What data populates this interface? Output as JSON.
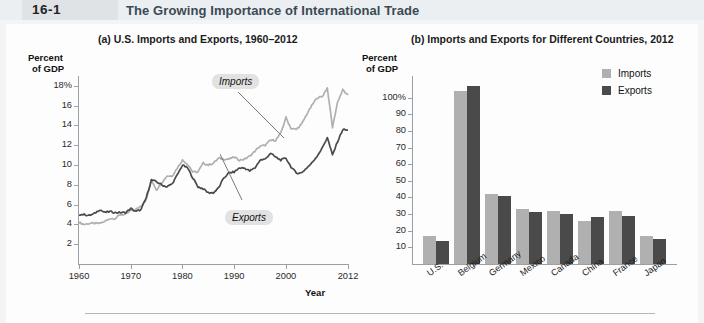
{
  "header": {
    "figure_word": "FIGURE",
    "figure_number": "16-1",
    "title": "The Growing Importance of International Trade",
    "badge_color": "#dfe3e6",
    "band_color": "#eceff1",
    "title_color": "#3a4a55"
  },
  "colors": {
    "imports": "#b0b0b0",
    "exports": "#4a4a4a",
    "axis": "#9aa0a4",
    "callout_bg": "#e2e2e2"
  },
  "panel_a": {
    "title": "(a) U.S. Imports and Exports, 1960–2012",
    "ylabel_line1": "Percent",
    "ylabel_line2": "of GDP",
    "xlabel": "Year",
    "callout_imports": "Imports",
    "callout_exports": "Exports",
    "yticks": [
      "18%",
      "16",
      "14",
      "12",
      "10",
      "8",
      "6",
      "4",
      "2"
    ],
    "xticks": [
      "1960",
      "1970",
      "1980",
      "1990",
      "2000",
      "2012"
    ]
  },
  "panel_b": {
    "title": "(b) Imports and Exports for Different Countries, 2012",
    "ylabel_line1": "Percent",
    "ylabel_line2": "of GDP",
    "yticks": [
      "100%",
      "90",
      "80",
      "70",
      "60",
      "50",
      "40",
      "30",
      "20",
      "10"
    ],
    "legend": [
      {
        "label": "Imports",
        "color": "#b0b0b0"
      },
      {
        "label": "Exports",
        "color": "#4a4a4a"
      }
    ]
  },
  "chart_data": [
    {
      "type": "line",
      "panel": "a",
      "title": "(a) U.S. Imports and Exports, 1960–2012",
      "xlabel": "Year",
      "ylabel": "Percent of GDP",
      "xlim": [
        1960,
        2012
      ],
      "ylim": [
        0,
        19
      ],
      "yticks": [
        2,
        4,
        6,
        8,
        10,
        12,
        14,
        16,
        18
      ],
      "xticks": [
        1960,
        1970,
        1980,
        1990,
        2000,
        2012
      ],
      "grid": false,
      "annotations": [
        "Imports",
        "Exports"
      ],
      "x": [
        1960,
        1961,
        1962,
        1963,
        1964,
        1965,
        1966,
        1967,
        1968,
        1969,
        1970,
        1971,
        1972,
        1973,
        1974,
        1975,
        1976,
        1977,
        1978,
        1979,
        1980,
        1981,
        1982,
        1983,
        1984,
        1985,
        1986,
        1987,
        1988,
        1989,
        1990,
        1991,
        1992,
        1993,
        1994,
        1995,
        1996,
        1997,
        1998,
        1999,
        2000,
        2001,
        2002,
        2003,
        2004,
        2005,
        2006,
        2007,
        2008,
        2009,
        2010,
        2011,
        2012
      ],
      "series": [
        {
          "name": "Imports",
          "color": "#b0b0b0",
          "values": [
            4.2,
            4.0,
            4.1,
            4.1,
            4.1,
            4.3,
            4.6,
            4.6,
            5.0,
            5.0,
            5.4,
            5.5,
            5.9,
            6.5,
            8.5,
            7.5,
            8.2,
            8.9,
            8.9,
            9.7,
            10.5,
            10.1,
            9.3,
            9.3,
            10.2,
            10.0,
            10.2,
            10.7,
            10.6,
            10.6,
            10.8,
            10.5,
            10.6,
            10.9,
            11.4,
            11.9,
            12.0,
            12.5,
            12.5,
            13.2,
            14.8,
            13.7,
            13.6,
            14.1,
            15.1,
            16.0,
            16.8,
            16.9,
            17.8,
            13.8,
            16.4,
            17.6,
            17.0
          ]
        },
        {
          "name": "Exports",
          "color": "#4a4a4a",
          "values": [
            5.0,
            5.0,
            4.9,
            5.1,
            5.5,
            5.2,
            5.3,
            5.2,
            5.2,
            5.2,
            5.6,
            5.3,
            5.5,
            6.7,
            8.5,
            8.3,
            8.0,
            7.8,
            8.1,
            9.0,
            10.0,
            9.7,
            8.7,
            7.8,
            7.6,
            7.2,
            7.2,
            7.7,
            8.7,
            9.2,
            9.3,
            9.7,
            9.7,
            9.4,
            9.7,
            10.5,
            10.6,
            11.2,
            10.8,
            10.5,
            10.7,
            9.8,
            9.2,
            9.2,
            9.7,
            10.2,
            10.9,
            11.7,
            12.8,
            11.0,
            12.4,
            13.6,
            13.5
          ]
        }
      ]
    },
    {
      "type": "bar",
      "panel": "b",
      "title": "(b) Imports and Exports for Different Countries, 2012",
      "ylabel": "Percent of GDP",
      "xlabel": "",
      "ylim": [
        0,
        110
      ],
      "yticks": [
        10,
        20,
        30,
        40,
        50,
        60,
        70,
        80,
        90,
        100
      ],
      "grid": false,
      "legend_position": "top-right",
      "categories": [
        "U.S.",
        "Belgium",
        "Germany",
        "Mexico",
        "Canada",
        "China",
        "France",
        "Japan"
      ],
      "series": [
        {
          "name": "Imports",
          "color": "#b0b0b0",
          "values": [
            17,
            104,
            42,
            33,
            32,
            26,
            32,
            17
          ]
        },
        {
          "name": "Exports",
          "color": "#4a4a4a",
          "values": [
            14,
            107,
            41,
            31,
            30,
            28,
            29,
            15
          ]
        }
      ]
    }
  ]
}
